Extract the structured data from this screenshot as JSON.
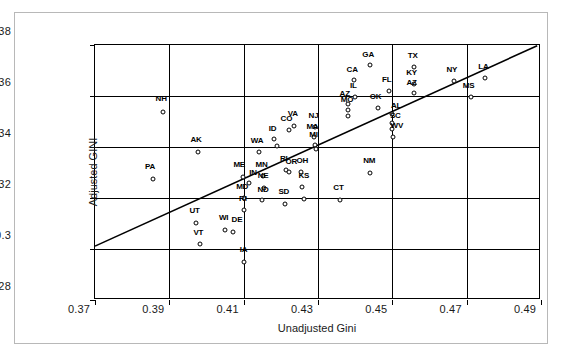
{
  "chart_data": {
    "type": "scatter",
    "title": "",
    "xlabel": "Unadjusted Gini",
    "ylabel": "Adjusted GINI",
    "xlim": [
      0.37,
      0.49
    ],
    "ylim": [
      0.28,
      0.38
    ],
    "xticks": [
      "0.37",
      "0.39",
      "0.41",
      "0.43",
      "0.45",
      "0.47",
      "0.49"
    ],
    "yticks": [
      "0.28",
      "0.3",
      "0.32",
      "0.34",
      "0.36",
      "0.38"
    ],
    "xtick_values": [
      0.37,
      0.39,
      0.41,
      0.43,
      0.45,
      0.47,
      0.49
    ],
    "ytick_values": [
      0.28,
      0.3,
      0.32,
      0.34,
      0.36,
      0.38
    ],
    "grid": true,
    "legend": "none",
    "marker": "open-circle",
    "reference_line": {
      "name": "45-degree-line",
      "x0": 0.37,
      "y0": 0.3005,
      "x1": 0.4895,
      "y1": 0.3797
    },
    "point_label_key": "state-abbreviation",
    "points": [
      {
        "label": "NH",
        "x": 0.3882,
        "y": 0.3538
      },
      {
        "label": "PA",
        "x": 0.3855,
        "y": 0.3275
      },
      {
        "label": "AK",
        "x": 0.3978,
        "y": 0.338
      },
      {
        "label": "UT",
        "x": 0.3972,
        "y": 0.3103
      },
      {
        "label": "VT",
        "x": 0.3983,
        "y": 0.3018
      },
      {
        "label": "WI",
        "x": 0.405,
        "y": 0.3075
      },
      {
        "label": "DE",
        "x": 0.4072,
        "y": 0.3068
      },
      {
        "label": "ME",
        "x": 0.4098,
        "y": 0.3283
      },
      {
        "label": "IN",
        "x": 0.4115,
        "y": 0.326
      },
      {
        "label": "MD",
        "x": 0.41,
        "y": 0.32
      },
      {
        "label": "RI",
        "x": 0.41,
        "y": 0.3152
      },
      {
        "label": "IA",
        "x": 0.41,
        "y": 0.2948
      },
      {
        "label": "WA",
        "x": 0.4142,
        "y": 0.338
      },
      {
        "label": "MN",
        "x": 0.4152,
        "y": 0.3285
      },
      {
        "label": "NE",
        "x": 0.4155,
        "y": 0.324
      },
      {
        "label": "ND",
        "x": 0.4148,
        "y": 0.3192
      },
      {
        "label": "ID",
        "x": 0.4182,
        "y": 0.343
      },
      {
        "label": "ID2",
        "x": 0.419,
        "y": 0.3405
      },
      {
        "label": "CO",
        "x": 0.4222,
        "y": 0.3465
      },
      {
        "label": "VA",
        "x": 0.4235,
        "y": 0.3482
      },
      {
        "label": "RI2",
        "x": 0.4215,
        "y": 0.331
      },
      {
        "label": "OR",
        "x": 0.4222,
        "y": 0.3302
      },
      {
        "label": "SD",
        "x": 0.4212,
        "y": 0.3178
      },
      {
        "label": "OH",
        "x": 0.4255,
        "y": 0.3302
      },
      {
        "label": "KS",
        "x": 0.4258,
        "y": 0.3242
      },
      {
        "label": "KS2",
        "x": 0.4262,
        "y": 0.3198
      },
      {
        "label": "MA",
        "x": 0.429,
        "y": 0.3438
      },
      {
        "label": "MI",
        "x": 0.4292,
        "y": 0.3408
      },
      {
        "label": "MT",
        "x": 0.4295,
        "y": 0.3392
      },
      {
        "label": "NJ",
        "x": 0.4292,
        "y": 0.3478
      },
      {
        "label": "AZ",
        "x": 0.4382,
        "y": 0.3568
      },
      {
        "label": "MO",
        "x": 0.438,
        "y": 0.3545
      },
      {
        "label": "DC",
        "x": 0.4382,
        "y": 0.3522
      },
      {
        "label": "IL",
        "x": 0.44,
        "y": 0.3598
      },
      {
        "label": "CA",
        "x": 0.4398,
        "y": 0.3662
      },
      {
        "label": "GA",
        "x": 0.444,
        "y": 0.3722
      },
      {
        "label": "CT",
        "x": 0.436,
        "y": 0.3192
      },
      {
        "label": "NM",
        "x": 0.444,
        "y": 0.3298
      },
      {
        "label": "OK",
        "x": 0.4462,
        "y": 0.3552
      },
      {
        "label": "FL",
        "x": 0.449,
        "y": 0.3618
      },
      {
        "label": "AL",
        "x": 0.4498,
        "y": 0.353
      },
      {
        "label": "SC",
        "x": 0.45,
        "y": 0.3495
      },
      {
        "label": "WV",
        "x": 0.4502,
        "y": 0.344
      },
      {
        "label": "TN",
        "x": 0.45,
        "y": 0.347
      },
      {
        "label": "TX",
        "x": 0.4558,
        "y": 0.3712
      },
      {
        "label": "KY",
        "x": 0.4558,
        "y": 0.3648
      },
      {
        "label": "AZ2",
        "x": 0.4558,
        "y": 0.3612
      },
      {
        "label": "NY",
        "x": 0.4665,
        "y": 0.3658
      },
      {
        "label": "MS",
        "x": 0.4712,
        "y": 0.3598
      },
      {
        "label": "LA",
        "x": 0.4748,
        "y": 0.3672
      }
    ],
    "labels": [
      {
        "text": "NH",
        "x": 0.3878,
        "y": 0.3588
      },
      {
        "text": "PA",
        "x": 0.3848,
        "y": 0.3322
      },
      {
        "text": "AK",
        "x": 0.3972,
        "y": 0.3428
      },
      {
        "text": "UT",
        "x": 0.3968,
        "y": 0.3148
      },
      {
        "text": "VT",
        "x": 0.3978,
        "y": 0.3062
      },
      {
        "text": "WI",
        "x": 0.4046,
        "y": 0.3122
      },
      {
        "text": "DE",
        "x": 0.4082,
        "y": 0.3112
      },
      {
        "text": "ME",
        "x": 0.4088,
        "y": 0.3328
      },
      {
        "text": "IN",
        "x": 0.4125,
        "y": 0.33
      },
      {
        "text": "MD",
        "x": 0.4096,
        "y": 0.3245
      },
      {
        "text": "RI",
        "x": 0.4098,
        "y": 0.3198
      },
      {
        "text": "IA",
        "x": 0.41,
        "y": 0.2995
      },
      {
        "text": "WA",
        "x": 0.4136,
        "y": 0.3425
      },
      {
        "text": "MN",
        "x": 0.4148,
        "y": 0.333
      },
      {
        "text": "NE",
        "x": 0.4152,
        "y": 0.3285
      },
      {
        "text": "ND",
        "x": 0.4152,
        "y": 0.3232
      },
      {
        "text": "ID",
        "x": 0.4178,
        "y": 0.347
      },
      {
        "text": "CO",
        "x": 0.4215,
        "y": 0.3508
      },
      {
        "text": "VA",
        "x": 0.4232,
        "y": 0.3528
      },
      {
        "text": "RI",
        "x": 0.4208,
        "y": 0.3352
      },
      {
        "text": "OR",
        "x": 0.4228,
        "y": 0.334
      },
      {
        "text": "SD",
        "x": 0.4208,
        "y": 0.3222
      },
      {
        "text": "OH",
        "x": 0.4258,
        "y": 0.3345
      },
      {
        "text": "KS",
        "x": 0.4262,
        "y": 0.3285
      },
      {
        "text": "MA",
        "x": 0.4285,
        "y": 0.348
      },
      {
        "text": "MI",
        "x": 0.4288,
        "y": 0.3448
      },
      {
        "text": "NJ",
        "x": 0.4288,
        "y": 0.3522
      },
      {
        "text": "AZ",
        "x": 0.4372,
        "y": 0.3608
      },
      {
        "text": "MO",
        "x": 0.4378,
        "y": 0.3585
      },
      {
        "text": "IL",
        "x": 0.4395,
        "y": 0.3638
      },
      {
        "text": "CA",
        "x": 0.4392,
        "y": 0.3702
      },
      {
        "text": "GA",
        "x": 0.4435,
        "y": 0.3762
      },
      {
        "text": "CT",
        "x": 0.4355,
        "y": 0.3238
      },
      {
        "text": "NM",
        "x": 0.4438,
        "y": 0.3345
      },
      {
        "text": "OK",
        "x": 0.4455,
        "y": 0.3595
      },
      {
        "text": "FL",
        "x": 0.4485,
        "y": 0.3662
      },
      {
        "text": "AL",
        "x": 0.451,
        "y": 0.3562
      },
      {
        "text": "SC",
        "x": 0.4508,
        "y": 0.352
      },
      {
        "text": "WV",
        "x": 0.4512,
        "y": 0.3482
      },
      {
        "text": "TX",
        "x": 0.4555,
        "y": 0.3758
      },
      {
        "text": "KY",
        "x": 0.4552,
        "y": 0.3692
      },
      {
        "text": "AZ",
        "x": 0.4552,
        "y": 0.3652
      },
      {
        "text": "NY",
        "x": 0.466,
        "y": 0.3702
      },
      {
        "text": "MS",
        "x": 0.4705,
        "y": 0.3638
      },
      {
        "text": "LA",
        "x": 0.4745,
        "y": 0.3712
      }
    ]
  }
}
